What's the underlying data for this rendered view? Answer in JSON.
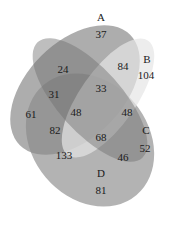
{
  "diagram": {
    "type": "venn-4-set",
    "sets": [
      {
        "name": "A",
        "color": "#8c8c8c"
      },
      {
        "name": "B",
        "color": "#dadada"
      },
      {
        "name": "C",
        "color": "#7e7e7e"
      },
      {
        "name": "D",
        "color": "#a8a8a8"
      }
    ],
    "set_labels": {
      "A": "A",
      "B": "B",
      "C": "C",
      "D": "D"
    },
    "regions": {
      "A_only": "37",
      "B_only": "104",
      "C_only": "52",
      "D_only": "81",
      "A_B": "84",
      "A_C_upper": "24",
      "A_C_D": "31",
      "A_D": "61",
      "A_B_C": "33",
      "A_B_C_D": "48",
      "B_C": "48",
      "A_C_D_B_lower": "82",
      "B_C_D": "68",
      "B_D": "133",
      "C_D": "46"
    }
  }
}
